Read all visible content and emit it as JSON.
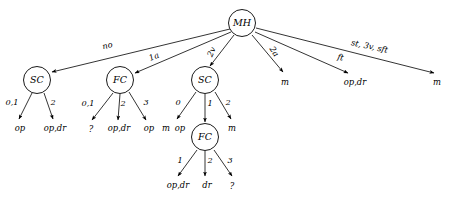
{
  "diagram": {
    "stroke_color": "#000000",
    "fill_color": "#ffffff",
    "background": "#ffffff",
    "nodes": [
      {
        "id": "MH",
        "label": "MH",
        "x": 242,
        "y": 23,
        "r": 13.5
      },
      {
        "id": "SC1",
        "label": "SC",
        "x": 37,
        "y": 80,
        "r": 13.5
      },
      {
        "id": "FC1",
        "label": "FC",
        "x": 120,
        "y": 80,
        "r": 13.5
      },
      {
        "id": "SC2",
        "label": "SC",
        "x": 205,
        "y": 80,
        "r": 13.5
      },
      {
        "id": "FC2",
        "label": "FC",
        "x": 205,
        "y": 137,
        "r": 13.5
      }
    ],
    "edges": [
      {
        "from": "MH",
        "to": "SC1",
        "label": "no",
        "x1": 230,
        "y1": 29,
        "x2": 52,
        "y2": 72,
        "lx": 108,
        "ly": 48,
        "rot": -13,
        "arrow": true
      },
      {
        "from": "MH",
        "to": "FC1",
        "label": "1a",
        "x1": 231,
        "y1": 32,
        "x2": 135,
        "y2": 73,
        "lx": 155,
        "ly": 59,
        "rot": -23,
        "arrow": true
      },
      {
        "from": "MH",
        "to": "SC2",
        "label": "2v",
        "x1": 234,
        "y1": 35,
        "x2": 210,
        "y2": 66,
        "lx": 214,
        "ly": 53,
        "rot": -66,
        "arrow": true
      },
      {
        "from": "MH",
        "to": "m1",
        "label": "2a",
        "x1": 252,
        "y1": 35,
        "x2": 283,
        "y2": 72,
        "lx": 272,
        "ly": 53,
        "rot": 56,
        "arrow": true
      },
      {
        "from": "MH",
        "to": "opdr",
        "label": "ft",
        "x1": 255,
        "y1": 32,
        "x2": 348,
        "y2": 73,
        "lx": 340,
        "ly": 60,
        "rot": 12,
        "arrow": true
      },
      {
        "from": "MH",
        "to": "m2",
        "label": "st, 3v, sft",
        "x1": 256,
        "y1": 28,
        "x2": 434,
        "y2": 73,
        "lx": 369,
        "ly": 49,
        "rot": 12,
        "arrow": true
      },
      {
        "from": "SC1",
        "to": "l1",
        "label": "0,1",
        "x1": 32,
        "y1": 93,
        "x2": 19,
        "y2": 119,
        "lx": 12,
        "ly": 105,
        "rot": 0,
        "arrow": true
      },
      {
        "from": "SC1",
        "to": "l2",
        "label": "2",
        "x1": 44,
        "y1": 93,
        "x2": 53,
        "y2": 119,
        "lx": 53,
        "ly": 105,
        "rot": 0,
        "arrow": true
      },
      {
        "from": "FC1",
        "to": "l3",
        "label": "0,1",
        "x1": 113,
        "y1": 93,
        "x2": 92,
        "y2": 120,
        "lx": 88,
        "ly": 106,
        "rot": 0,
        "arrow": true
      },
      {
        "from": "FC1",
        "to": "l4",
        "label": "2",
        "x1": 120,
        "y1": 94,
        "x2": 118,
        "y2": 120,
        "lx": 123,
        "ly": 106,
        "rot": 0,
        "arrow": true
      },
      {
        "from": "FC1",
        "to": "l5",
        "label": "3",
        "x1": 129,
        "y1": 92,
        "x2": 146,
        "y2": 120,
        "lx": 146,
        "ly": 105,
        "rot": 0,
        "arrow": true
      },
      {
        "from": "SC2",
        "to": "l6",
        "label": "0",
        "x1": 196,
        "y1": 92,
        "x2": 177,
        "y2": 119,
        "lx": 178,
        "ly": 105,
        "rot": 0,
        "arrow": true
      },
      {
        "from": "SC2",
        "to": "FC2",
        "label": "1",
        "x1": 205,
        "y1": 94,
        "x2": 205,
        "y2": 122,
        "lx": 210,
        "ly": 106,
        "rot": 0,
        "arrow": true
      },
      {
        "from": "SC2",
        "to": "l7",
        "label": "2",
        "x1": 215,
        "y1": 92,
        "x2": 231,
        "y2": 119,
        "lx": 228,
        "ly": 105,
        "rot": 0,
        "arrow": true
      },
      {
        "from": "FC2",
        "to": "l8",
        "label": "1",
        "x1": 197,
        "y1": 150,
        "x2": 178,
        "y2": 176,
        "lx": 180,
        "ly": 163,
        "rot": 0,
        "arrow": true
      },
      {
        "from": "FC2",
        "to": "l9",
        "label": "2",
        "x1": 205,
        "y1": 151,
        "x2": 205,
        "y2": 176,
        "lx": 210,
        "ly": 163,
        "rot": 0,
        "arrow": true
      },
      {
        "from": "FC2",
        "to": "l10",
        "label": "3",
        "x1": 214,
        "y1": 150,
        "x2": 232,
        "y2": 176,
        "lx": 230,
        "ly": 163,
        "rot": 0,
        "arrow": true
      }
    ],
    "leaves": [
      {
        "id": "l1",
        "label": "op",
        "x": 20,
        "y": 131
      },
      {
        "id": "l2",
        "label": "op,dr",
        "x": 55,
        "y": 131
      },
      {
        "id": "l3",
        "label": "?",
        "x": 91,
        "y": 132
      },
      {
        "id": "l4",
        "label": "op,dr",
        "x": 119,
        "y": 131
      },
      {
        "id": "l5",
        "label": "op",
        "x": 149,
        "y": 131
      },
      {
        "id": "l6",
        "label": "m",
        "x": 166,
        "y": 131
      },
      {
        "id": "l6b",
        "label": "op",
        "x": 180,
        "y": 131
      },
      {
        "id": "l7",
        "label": "m",
        "x": 232,
        "y": 131
      },
      {
        "id": "l8",
        "label": "op,dr",
        "x": 178,
        "y": 188
      },
      {
        "id": "l9",
        "label": "dr",
        "x": 207,
        "y": 188
      },
      {
        "id": "l10",
        "label": "?",
        "x": 232,
        "y": 189
      },
      {
        "id": "m1",
        "label": "m",
        "x": 285,
        "y": 85
      },
      {
        "id": "opdr",
        "label": "op,dr",
        "x": 355,
        "y": 85
      },
      {
        "id": "m2",
        "label": "m",
        "x": 437,
        "y": 85
      }
    ]
  }
}
